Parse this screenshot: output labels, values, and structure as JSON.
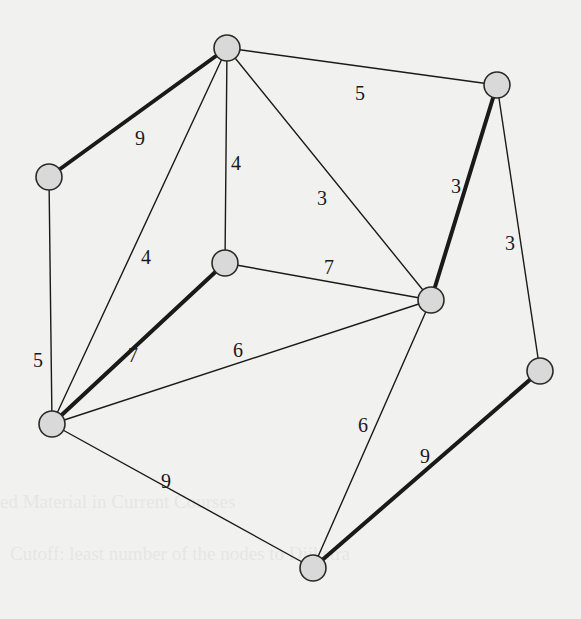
{
  "figure": {
    "type": "weighted-graph",
    "background": "#f1f1ef",
    "node_fill": "#d9d9d9",
    "node_stroke": "#2a2a2a",
    "edge_color": "#1a1a1a",
    "node_radius": 13
  },
  "nodes": [
    {
      "id": "A",
      "x": 227,
      "y": 48
    },
    {
      "id": "B",
      "x": 497,
      "y": 85
    },
    {
      "id": "C",
      "x": 49,
      "y": 177
    },
    {
      "id": "D",
      "x": 225,
      "y": 263
    },
    {
      "id": "E",
      "x": 431,
      "y": 300
    },
    {
      "id": "F",
      "x": 540,
      "y": 371
    },
    {
      "id": "G",
      "x": 52,
      "y": 424
    },
    {
      "id": "H",
      "x": 313,
      "y": 568
    }
  ],
  "edges": [
    {
      "from": "A",
      "to": "C",
      "weight": "9",
      "highlighted": true,
      "lx": 140,
      "ly": 140
    },
    {
      "from": "A",
      "to": "B",
      "weight": "5",
      "highlighted": false,
      "lx": 360,
      "ly": 95
    },
    {
      "from": "A",
      "to": "D",
      "weight": "4",
      "highlighted": false,
      "lx": 236,
      "ly": 165
    },
    {
      "from": "A",
      "to": "G",
      "weight": "4",
      "highlighted": false,
      "lx": 146,
      "ly": 259
    },
    {
      "from": "A",
      "to": "E",
      "weight": "3",
      "highlighted": false,
      "lx": 322,
      "ly": 200
    },
    {
      "from": "C",
      "to": "G",
      "weight": "5",
      "highlighted": false,
      "lx": 38,
      "ly": 362
    },
    {
      "from": "D",
      "to": "G",
      "weight": "7",
      "highlighted": true,
      "lx": 133,
      "ly": 357
    },
    {
      "from": "D",
      "to": "E",
      "weight": "7",
      "highlighted": false,
      "lx": 329,
      "ly": 269
    },
    {
      "from": "G",
      "to": "E",
      "weight": "6",
      "highlighted": false,
      "lx": 238,
      "ly": 352
    },
    {
      "from": "B",
      "to": "E",
      "weight": "3",
      "highlighted": true,
      "lx": 456,
      "ly": 188
    },
    {
      "from": "B",
      "to": "F",
      "weight": "3",
      "highlighted": false,
      "lx": 510,
      "ly": 245
    },
    {
      "from": "G",
      "to": "H",
      "weight": "9",
      "highlighted": false,
      "lx": 166,
      "ly": 483
    },
    {
      "from": "E",
      "to": "H",
      "weight": "6",
      "highlighted": false,
      "lx": 363,
      "ly": 427
    },
    {
      "from": "F",
      "to": "H",
      "weight": "9",
      "highlighted": true,
      "lx": 425,
      "ly": 458
    }
  ],
  "show_through_text": [
    {
      "text": "ed Material in Current Courses",
      "x": 0,
      "y": 508
    },
    {
      "text": "Cutoff: least number of the nodes to Dijkstra",
      "x": 10,
      "y": 560
    }
  ]
}
